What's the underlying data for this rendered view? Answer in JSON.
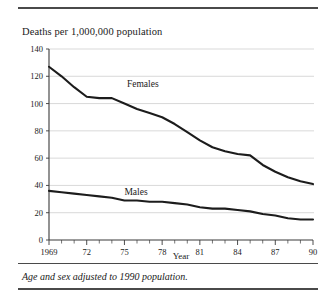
{
  "figure": {
    "title": "Deaths per 1,000,000 population",
    "footnote": "Age and sex adjusted to 1990 population.",
    "xaxis_title": "Year"
  },
  "labels": {
    "females": "Females",
    "males": "Males"
  },
  "chart_data": {
    "type": "line",
    "title": "Deaths per 1,000,000 population",
    "xlabel": "Year",
    "ylabel": "",
    "xlim": [
      1969,
      1990
    ],
    "ylim": [
      0,
      140
    ],
    "ytick_values": [
      0,
      20,
      40,
      60,
      80,
      100,
      120,
      140
    ],
    "ytick_labels": [
      "0",
      "20",
      "40",
      "60",
      "80",
      "100",
      "120",
      "140"
    ],
    "xtick_values": [
      1969,
      1972,
      1975,
      1978,
      1981,
      1984,
      1987,
      1990
    ],
    "xtick_labels": [
      "1969",
      "72",
      "75",
      "78",
      "81",
      "84",
      "87",
      "90"
    ],
    "minor_xticks_every": 1,
    "grid": "horizontal",
    "legend": "inline-annotations",
    "x": [
      1969,
      1970,
      1971,
      1972,
      1973,
      1974,
      1975,
      1976,
      1977,
      1978,
      1979,
      1980,
      1981,
      1982,
      1983,
      1984,
      1985,
      1986,
      1987,
      1988,
      1989,
      1990
    ],
    "series": [
      {
        "name": "Females",
        "values": [
          127,
          120,
          112,
          105,
          104,
          104,
          100,
          96,
          93,
          90,
          85,
          79,
          73,
          68,
          65,
          63,
          62,
          55,
          50,
          46,
          43,
          41
        ]
      },
      {
        "name": "Males",
        "values": [
          36,
          35,
          34,
          33,
          32,
          31,
          29,
          29,
          28,
          28,
          27,
          26,
          24,
          23,
          23,
          22,
          21,
          19,
          18,
          16,
          15,
          15
        ]
      }
    ],
    "annotations": [
      {
        "text": "Females",
        "x": 1975.2,
        "y": 112
      },
      {
        "text": "Males",
        "x": 1975.0,
        "y": 33
      }
    ]
  }
}
